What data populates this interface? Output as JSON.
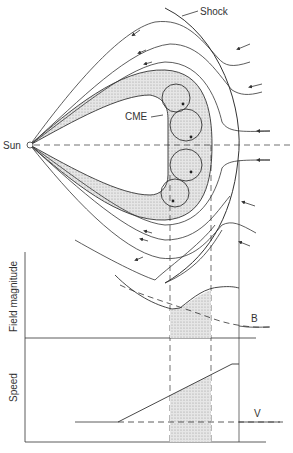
{
  "labels": {
    "shock": "Shock",
    "cme": "CME",
    "sun": "Sun",
    "field_axis": "Field magnitude",
    "speed_axis": "Speed",
    "b_curve": "B",
    "v_curve": "V"
  },
  "colors": {
    "line": "#333333",
    "shade": "#d8d8d8",
    "background": "#ffffff"
  }
}
